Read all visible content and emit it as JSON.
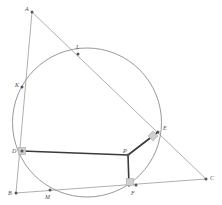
{
  "figure": {
    "name": "circle-triangle-construction",
    "canvas": {
      "width": 222,
      "height": 205
    },
    "background_color": "#ffffff",
    "stroke_thin_color": "#9a9a9a",
    "stroke_thick_color": "#3a3a3a",
    "point_color": "#555555",
    "label_color": "#4a4a4a",
    "right_angle_marker_color": "#b0b0b0",
    "right_angle_marker_fill": "#cfcfcf"
  },
  "circle": {
    "label": "circle",
    "cx": 87,
    "cy": 122.5,
    "r": 74.5,
    "stroke": "#8d8d8d",
    "stroke_width": 0.9,
    "fill": "none"
  },
  "points": [
    {
      "id": "A",
      "label": "A",
      "x": 32,
      "y": 12,
      "lx": 25,
      "ly": 6,
      "on_circle": false
    },
    {
      "id": "L",
      "label": "L",
      "x": 78,
      "y": 54,
      "lx": 76,
      "ly": 44,
      "on_circle": true
    },
    {
      "id": "K",
      "label": "K",
      "x": 22,
      "y": 87,
      "lx": 15,
      "ly": 82,
      "on_circle": true
    },
    {
      "id": "E",
      "label": "E",
      "x": 158,
      "y": 132,
      "lx": 163,
      "ly": 125,
      "on_circle": true
    },
    {
      "id": "D",
      "label": "D",
      "x": 22,
      "y": 151,
      "lx": 12,
      "ly": 148,
      "on_circle": true
    },
    {
      "id": "P",
      "label": "P",
      "x": 128,
      "y": 155,
      "lx": 123,
      "ly": 148,
      "on_circle": false
    },
    {
      "id": "B",
      "label": "B",
      "x": 16,
      "y": 193,
      "lx": 8,
      "ly": 190,
      "on_circle": false
    },
    {
      "id": "M",
      "label": "M",
      "x": 50,
      "y": 190,
      "lx": 45,
      "ly": 194,
      "on_circle": true
    },
    {
      "id": "F",
      "label": "F",
      "x": 136,
      "y": 185,
      "lx": 131,
      "ly": 190,
      "on_circle": true
    },
    {
      "id": "C",
      "label": "C",
      "x": 206,
      "y": 179,
      "lx": 210,
      "ly": 175,
      "on_circle": false
    }
  ],
  "thin_lines": [
    {
      "id": "AC",
      "label": "line-A-C",
      "from": "A",
      "to": "C",
      "x1": 32,
      "y1": 12,
      "x2": 206,
      "y2": 179
    },
    {
      "id": "AB",
      "label": "line-A-B",
      "from": "A",
      "to": "B",
      "x1": 32,
      "y1": 12,
      "x2": 16,
      "y2": 193
    },
    {
      "id": "BC",
      "label": "line-B-C",
      "from": "B",
      "to": "C",
      "x1": 16,
      "y1": 193,
      "x2": 206,
      "y2": 179
    }
  ],
  "thick_lines": [
    {
      "id": "DP",
      "label": "segment-D-P",
      "from": "D",
      "to": "P",
      "x1": 22,
      "y1": 151,
      "x2": 128,
      "y2": 155
    },
    {
      "id": "PE",
      "label": "segment-P-E",
      "from": "P",
      "to": "E",
      "x1": 128,
      "y1": 155,
      "x2": 158,
      "y2": 132
    },
    {
      "id": "PF",
      "label": "segment-P-F",
      "from": "P",
      "to": "F",
      "x1": 128,
      "y1": 155,
      "x2": 129,
      "y2": 186
    }
  ],
  "right_angle_markers": [
    {
      "id": "at-D",
      "label": "right-angle-at-D",
      "x": 22,
      "y": 151,
      "size": 7,
      "rotation": 0,
      "shape": "square"
    },
    {
      "id": "at-E",
      "label": "right-angle-at-E",
      "x": 153,
      "y": 136,
      "size": 7,
      "rotation": 45,
      "shape": "diamond"
    },
    {
      "id": "at-F",
      "label": "right-angle-at-F",
      "x": 130,
      "y": 182,
      "size": 7,
      "rotation": 0,
      "shape": "square"
    }
  ],
  "legend": {
    "description": "Circle with inscribed points; triangle ABC circumscribes arcs at K, L, M, E, F; polyline D-P-E and P-F with perpendicular marks at D, E and F."
  }
}
